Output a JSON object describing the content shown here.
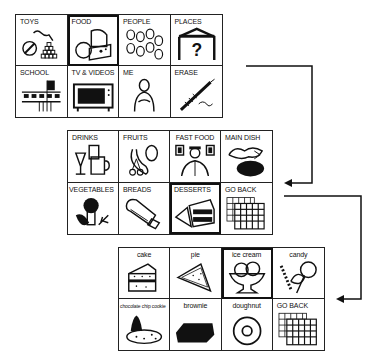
{
  "boards": [
    {
      "name": "main-categories",
      "cells": [
        {
          "label": "TOYS",
          "icon": "toys-icon",
          "selected": false
        },
        {
          "label": "FOOD",
          "icon": "food-icon",
          "selected": true
        },
        {
          "label": "PEOPLE",
          "icon": "people-icon",
          "selected": false
        },
        {
          "label": "PLACES",
          "icon": "places-icon",
          "selected": false
        },
        {
          "label": "SCHOOL",
          "icon": "school-icon",
          "selected": false
        },
        {
          "label": "TV & VIDEOS",
          "icon": "tv-icon",
          "selected": false
        },
        {
          "label": "ME",
          "icon": "me-icon",
          "selected": false
        },
        {
          "label": "ERASE",
          "icon": "erase-icon",
          "selected": false
        }
      ]
    },
    {
      "name": "food-categories",
      "cells": [
        {
          "label": "DRINKS",
          "icon": "drinks-icon",
          "selected": false
        },
        {
          "label": "FRUITS",
          "icon": "fruits-icon",
          "selected": false
        },
        {
          "label": "FAST FOOD",
          "icon": "fast-food-icon",
          "selected": false
        },
        {
          "label": "MAIN DISH",
          "icon": "main-dish-icon",
          "selected": false
        },
        {
          "label": "VEGETABLES",
          "icon": "vegetables-icon",
          "selected": false
        },
        {
          "label": "BREADS",
          "icon": "breads-icon",
          "selected": false
        },
        {
          "label": "DESSERTS",
          "icon": "desserts-icon",
          "selected": true
        },
        {
          "label": "GO BACK",
          "icon": "go-back-icon",
          "selected": false
        }
      ]
    },
    {
      "name": "desserts",
      "cells": [
        {
          "label": "cake",
          "icon": "cake-icon",
          "selected": false
        },
        {
          "label": "pie",
          "icon": "pie-icon",
          "selected": false
        },
        {
          "label": "ice cream",
          "icon": "ice-cream-icon",
          "selected": true
        },
        {
          "label": "candy",
          "icon": "candy-icon",
          "selected": false
        },
        {
          "label": "chocolate chip cookie",
          "icon": "cookie-icon",
          "selected": false
        },
        {
          "label": "brownie",
          "icon": "brownie-icon",
          "selected": false
        },
        {
          "label": "doughnut",
          "icon": "doughnut-icon",
          "selected": false
        },
        {
          "label": "GO BACK",
          "icon": "go-back-icon",
          "selected": false
        }
      ]
    }
  ],
  "colors": {
    "ink": "#111111",
    "background": "#ffffff"
  }
}
